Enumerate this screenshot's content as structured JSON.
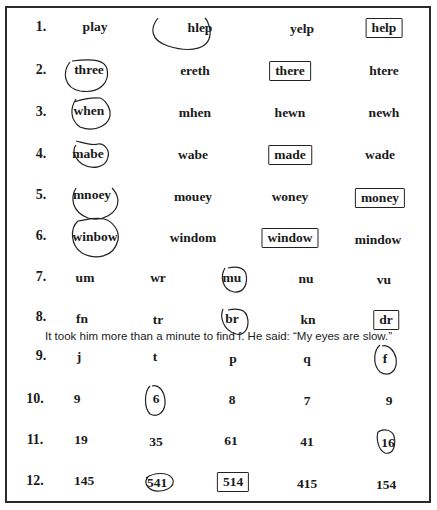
{
  "worksheet": {
    "rows": [
      {
        "number": "1.",
        "items": [
          "play",
          "hlep",
          "yelp",
          "help"
        ],
        "circled": [
          1
        ],
        "boxed": [
          3
        ]
      },
      {
        "number": "2.",
        "items": [
          "three",
          "ereth",
          "there",
          "htere"
        ],
        "circled": [
          0
        ],
        "boxed": [
          2
        ]
      },
      {
        "number": "3.",
        "items": [
          "when",
          "mhen",
          "hewn",
          "newh"
        ],
        "circled": [
          0
        ],
        "boxed": []
      },
      {
        "number": "4.",
        "items": [
          "mabe",
          "wabe",
          "made",
          "wade"
        ],
        "circled": [
          0
        ],
        "boxed": [
          2
        ]
      },
      {
        "number": "5.",
        "items": [
          "mnoey",
          "mouey",
          "woney",
          "money"
        ],
        "circled": [
          0
        ],
        "boxed": [
          3
        ]
      },
      {
        "number": "6.",
        "items": [
          "winbow",
          "windom",
          "window",
          "mindow"
        ],
        "circled": [
          0
        ],
        "boxed": [
          2
        ]
      },
      {
        "number": "7.",
        "items": [
          "um",
          "wr",
          "mu",
          "nu",
          "vu"
        ],
        "circled": [
          2
        ],
        "boxed": []
      },
      {
        "number": "8.",
        "items": [
          "fn",
          "tr",
          "br",
          "kn",
          "dr"
        ],
        "circled": [
          2
        ],
        "boxed": [
          4
        ]
      },
      {
        "number": "9.",
        "items": [
          "j",
          "t",
          "p",
          "q",
          "f"
        ],
        "circled": [
          4
        ],
        "boxed": []
      },
      {
        "number": "10.",
        "items": [
          "9",
          "6",
          "8",
          "7",
          "9"
        ],
        "circled": [
          1
        ],
        "boxed": []
      },
      {
        "number": "11.",
        "items": [
          "19",
          "35",
          "61",
          "41",
          "16"
        ],
        "circled": [
          4
        ],
        "boxed": []
      },
      {
        "number": "12.",
        "items": [
          "145",
          "541",
          "514",
          "415",
          "154"
        ],
        "circled": [
          1
        ],
        "boxed": [
          2
        ]
      }
    ],
    "annotation": "It took him more than a minute to find f. He said: “My eyes are slow.”"
  }
}
